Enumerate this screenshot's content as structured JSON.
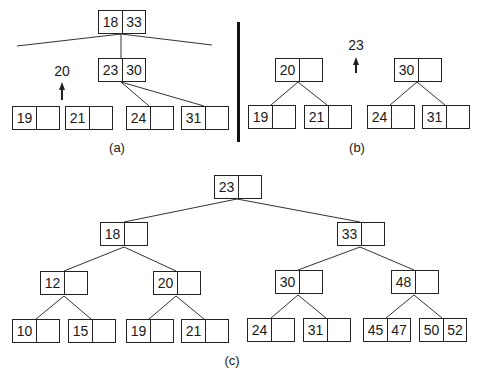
{
  "figure": {
    "panels": [
      {
        "id": "a",
        "caption": "(a)",
        "promoted_key": "20",
        "nodes": [
          {
            "id": "a_root",
            "keys": [
              "18",
              "33"
            ]
          },
          {
            "id": "a_mid",
            "keys": [
              "23",
              "30"
            ]
          },
          {
            "id": "a_l1",
            "keys": [
              "19",
              ""
            ]
          },
          {
            "id": "a_l2",
            "keys": [
              "21",
              ""
            ]
          },
          {
            "id": "a_l3",
            "keys": [
              "24",
              ""
            ]
          },
          {
            "id": "a_l4",
            "keys": [
              "31",
              ""
            ]
          }
        ]
      },
      {
        "id": "b",
        "caption": "(b)",
        "promoted_key": "23",
        "nodes": [
          {
            "id": "b_left",
            "keys": [
              "20",
              ""
            ]
          },
          {
            "id": "b_right",
            "keys": [
              "30",
              ""
            ]
          },
          {
            "id": "b_l1",
            "keys": [
              "19",
              ""
            ]
          },
          {
            "id": "b_l2",
            "keys": [
              "21",
              ""
            ]
          },
          {
            "id": "b_l3",
            "keys": [
              "24",
              ""
            ]
          },
          {
            "id": "b_l4",
            "keys": [
              "31",
              ""
            ]
          }
        ]
      },
      {
        "id": "c",
        "caption": "(c)",
        "nodes": [
          {
            "id": "c_root",
            "keys": [
              "23",
              ""
            ]
          },
          {
            "id": "c_18",
            "keys": [
              "18",
              ""
            ]
          },
          {
            "id": "c_33",
            "keys": [
              "33",
              ""
            ]
          },
          {
            "id": "c_12",
            "keys": [
              "12",
              ""
            ]
          },
          {
            "id": "c_20",
            "keys": [
              "20",
              ""
            ]
          },
          {
            "id": "c_30",
            "keys": [
              "30",
              ""
            ]
          },
          {
            "id": "c_48",
            "keys": [
              "48",
              ""
            ]
          },
          {
            "id": "c_10",
            "keys": [
              "10",
              ""
            ]
          },
          {
            "id": "c_15",
            "keys": [
              "15",
              ""
            ]
          },
          {
            "id": "c_19",
            "keys": [
              "19",
              ""
            ]
          },
          {
            "id": "c_21",
            "keys": [
              "21",
              ""
            ]
          },
          {
            "id": "c_24",
            "keys": [
              "24",
              ""
            ]
          },
          {
            "id": "c_31",
            "keys": [
              "31",
              ""
            ]
          },
          {
            "id": "c_4547",
            "keys": [
              "45",
              "47"
            ]
          },
          {
            "id": "c_5052",
            "keys": [
              "50",
              "52"
            ]
          }
        ]
      }
    ]
  }
}
